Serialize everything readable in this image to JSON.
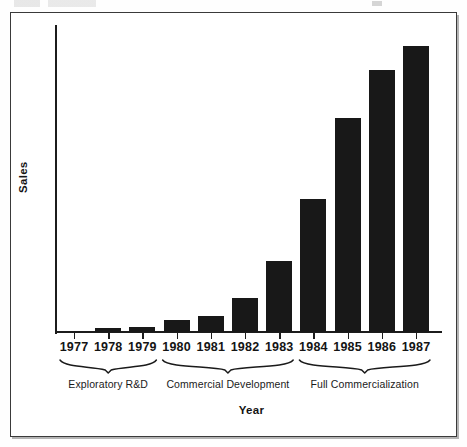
{
  "figure": {
    "width": 467,
    "height": 447,
    "background_color": "#ffffff",
    "frame_color": "#3a3a3a"
  },
  "chart_data": {
    "type": "bar",
    "title": "",
    "xlabel": "Year",
    "ylabel": "Sales",
    "categories": [
      "1977",
      "1978",
      "1979",
      "1980",
      "1981",
      "1982",
      "1983",
      "1984",
      "1985",
      "1986",
      "1987"
    ],
    "values": [
      0,
      4,
      5,
      12,
      16,
      34,
      71,
      133,
      214,
      262,
      286
    ],
    "ylim": [
      0,
      307
    ],
    "xlim_categories": 11,
    "grid": false,
    "legend": null,
    "bar_color": "#181818",
    "axis_color": "#1c1c1c",
    "y_axis_ticks_shown": false,
    "x_axis_ticks_shown": true,
    "annotations": [
      {
        "label": "Exploratory R&D",
        "span_start_category": "1977",
        "span_end_category": "1979",
        "style": "curly-brace-below-axis"
      },
      {
        "label": "Commercial Development",
        "span_start_category": "1980",
        "span_end_category": "1983",
        "style": "curly-brace-below-axis"
      },
      {
        "label": "Full Commercialization",
        "span_start_category": "1984",
        "span_end_category": "1987",
        "style": "curly-brace-below-axis"
      }
    ]
  },
  "axes": {
    "y_title": "Sales",
    "x_title": "Year"
  },
  "phases": [
    {
      "label": "Exploratory R&D"
    },
    {
      "label": "Commercial Development"
    },
    {
      "label": "Full Commercialization"
    }
  ]
}
